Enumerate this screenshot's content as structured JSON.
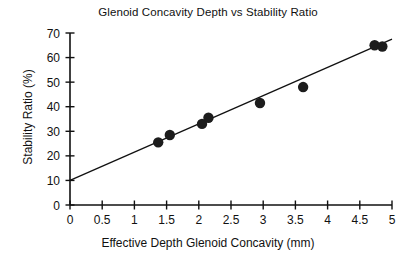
{
  "chart_data": {
    "type": "scatter",
    "title": "Glenoid Concavity Depth vs Stability Ratio",
    "xlabel": "Effective Depth Glenoid Concavity (mm)",
    "ylabel": "Stability Ratio (%)",
    "xlim": [
      0,
      5
    ],
    "ylim": [
      0,
      70
    ],
    "grid": false,
    "legend": null,
    "xticks": [
      0,
      0.5,
      1,
      1.5,
      2,
      2.5,
      3,
      3.5,
      4,
      4.5,
      5
    ],
    "xtick_labels": [
      "0",
      "0.5",
      "1",
      "1.5",
      "2",
      "2.5",
      "3",
      "3.5",
      "4",
      "4.5",
      "5"
    ],
    "yticks": [
      0,
      10,
      20,
      30,
      40,
      50,
      60,
      70
    ],
    "ytick_labels": [
      "0",
      "10",
      "20",
      "30",
      "40",
      "50",
      "60",
      "70"
    ],
    "marker": "filled-circle",
    "marker_color": "#1c1c1c",
    "x": [
      1.37,
      1.55,
      2.05,
      2.15,
      2.95,
      3.62,
      4.73,
      4.85
    ],
    "y": [
      25.5,
      28.5,
      33.0,
      35.5,
      41.5,
      48.0,
      65.0,
      64.5
    ],
    "points": [
      {
        "x": 1.37,
        "y": 25.5
      },
      {
        "x": 1.55,
        "y": 28.5
      },
      {
        "x": 2.05,
        "y": 33.0
      },
      {
        "x": 2.15,
        "y": 35.5
      },
      {
        "x": 2.95,
        "y": 41.5
      },
      {
        "x": 3.62,
        "y": 48.0
      },
      {
        "x": 4.73,
        "y": 65.0
      },
      {
        "x": 4.85,
        "y": 64.5
      }
    ],
    "trendline": {
      "type": "linear",
      "x0": 0,
      "y0": 10.0,
      "x1": 5,
      "y1": 67.5,
      "color": "#111111"
    }
  }
}
